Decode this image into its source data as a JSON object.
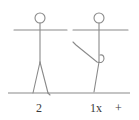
{
  "diagram": {
    "type": "exercise-stick-figure-notation",
    "stroke_color": "#8a8a8a",
    "text_color": "#3a3a3a",
    "figures": [
      {
        "id": "figure-1",
        "pose": "standing, arms out horizontally, legs apart",
        "label": "2"
      },
      {
        "id": "figure-2",
        "pose": "standing on one leg, arm bent down to knee",
        "label": "1x"
      }
    ],
    "extra_symbol": "+",
    "ground_line": true
  }
}
